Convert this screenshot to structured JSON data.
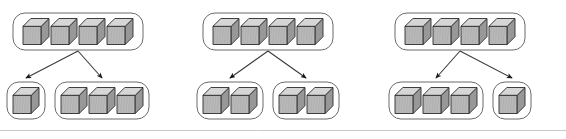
{
  "figure": {
    "background_color": "#ffffff",
    "box_stroke_color": "#6b6b6b",
    "arrow_color": "#1a1a1a",
    "cube_outline_color": "#2b2b2b",
    "cube_top_color": "#d6d6d6",
    "cube_left_color": "#b9b9b9",
    "cube_right_color": "#9c9c9c",
    "divider_color": "#c8c8c8"
  },
  "panels": [
    {
      "name": "panel-left",
      "parent": {
        "label": "parent-group",
        "cube_count": 4
      },
      "children": [
        {
          "label": "child-group-left",
          "cube_count": 1
        },
        {
          "label": "child-group-right",
          "cube_count": 3
        }
      ],
      "split": "1 + 3"
    },
    {
      "name": "panel-middle",
      "parent": {
        "label": "parent-group",
        "cube_count": 4
      },
      "children": [
        {
          "label": "child-group-left",
          "cube_count": 2
        },
        {
          "label": "child-group-right",
          "cube_count": 2
        }
      ],
      "split": "2 + 2"
    },
    {
      "name": "panel-right",
      "parent": {
        "label": "parent-group",
        "cube_count": 4
      },
      "children": [
        {
          "label": "child-group-left",
          "cube_count": 3
        },
        {
          "label": "child-group-right",
          "cube_count": 1
        }
      ],
      "split": "3 + 1"
    }
  ],
  "geometry": {
    "panel_origins": [
      0,
      190,
      382
    ],
    "parent_box": {
      "x": 13,
      "y": 13,
      "w": 130,
      "h": 37,
      "rx": 12
    },
    "child_row_y": 82,
    "child_box_h": 37,
    "cube_size": 26,
    "divider_y": 130.5
  },
  "divider": {
    "name": "bottom-divider",
    "visible": true
  }
}
